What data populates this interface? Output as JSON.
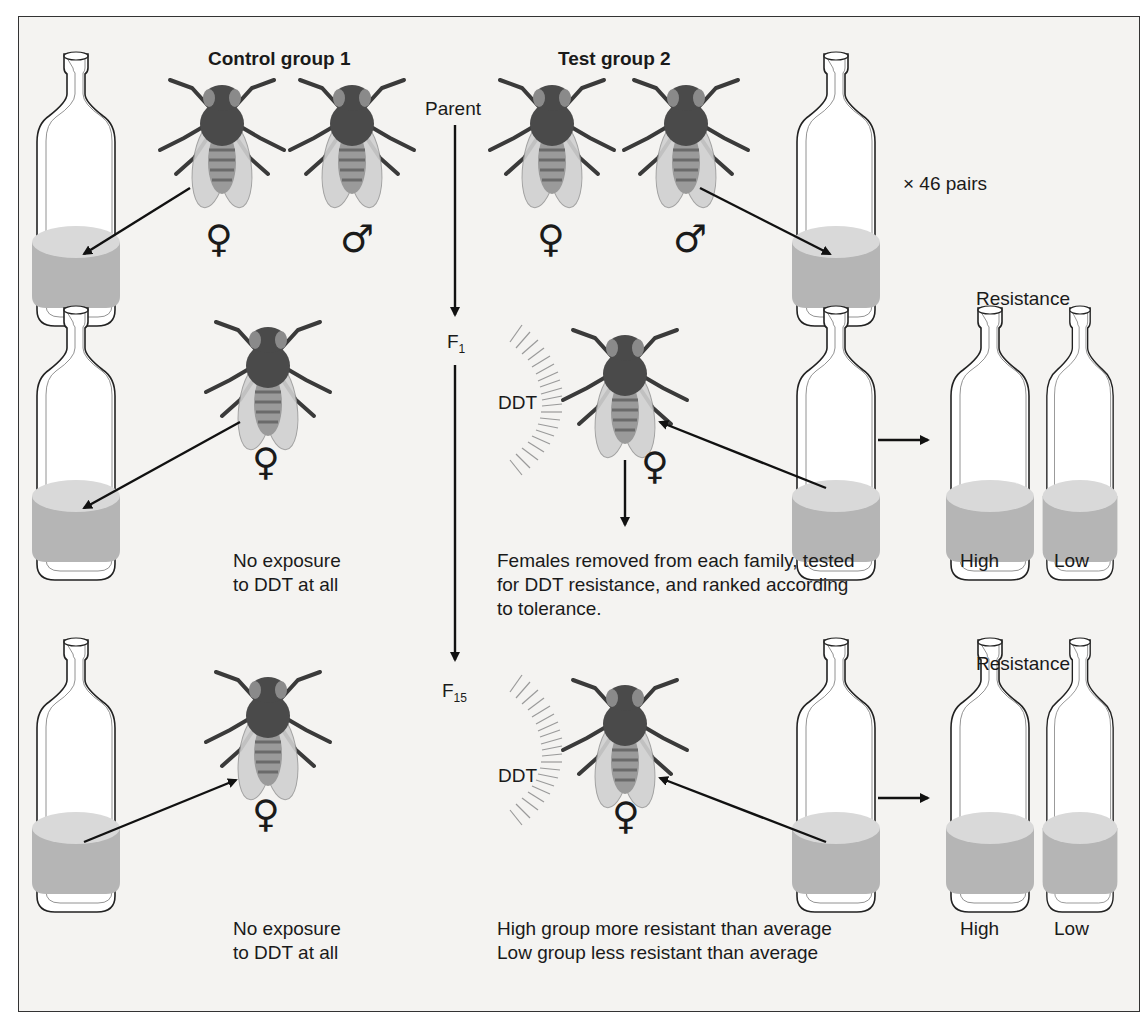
{
  "groups": {
    "control": "Control group 1",
    "test": "Test group 2"
  },
  "generations": {
    "parent": "Parent",
    "f1": {
      "base": "F",
      "sub": "1"
    },
    "f15": {
      "base": "F",
      "sub": "15"
    }
  },
  "symbols": {
    "female": "♀",
    "male": "♂"
  },
  "labels": {
    "pairs": "× 46 pairs",
    "ddt": "DDT",
    "resistance": "Resistance",
    "high": "High",
    "low": "Low"
  },
  "notes": {
    "control_f1_line1": "No exposure",
    "control_f1_line2": "to DDT at all",
    "control_f15_line1": "No exposure",
    "control_f15_line2": "to DDT at all",
    "test_f1_line1": "Females removed from each family, tested",
    "test_f1_line2": "for DDT resistance, and ranked according",
    "test_f1_line3": "to tolerance.",
    "test_f15_line1": "High group more resistant than average",
    "test_f15_line2": "Low group less resistant than average"
  },
  "colors": {
    "fly_body": "#4a4a4a",
    "fly_wing": "#cfcfcf",
    "medium_top": "#d8d8d8",
    "medium_side": "#b3b3b3",
    "background": "#f4f3f1"
  }
}
